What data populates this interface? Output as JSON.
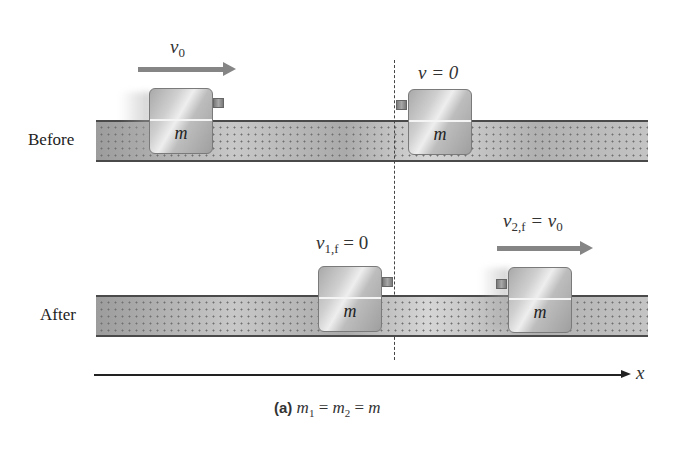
{
  "figure": {
    "caption_tag": "(a)",
    "caption_eq": [
      "m",
      "1",
      " = ",
      "m",
      "2",
      " = ",
      "m"
    ],
    "axis_label": "x",
    "before": {
      "label": "Before",
      "block1": {
        "mass_label": "m",
        "velocity_symbol": "v",
        "velocity_sub": "0"
      },
      "block2": {
        "mass_label": "m",
        "velocity_text": "v = 0"
      }
    },
    "after": {
      "label": "After",
      "block1": {
        "mass_label": "m",
        "velocity_symbol": "v",
        "velocity_sub": "1,f",
        "velocity_rhs": " = 0"
      },
      "block2": {
        "mass_label": "m",
        "velocity_symbol": "v",
        "velocity_sub": "2,f",
        "velocity_rhs_symbol": " = v",
        "velocity_rhs_sub": "0"
      }
    }
  },
  "colors": {
    "track": "#b9b9b9",
    "block": "#c4c4c4",
    "arrow": "#858585",
    "line": "#222222"
  }
}
